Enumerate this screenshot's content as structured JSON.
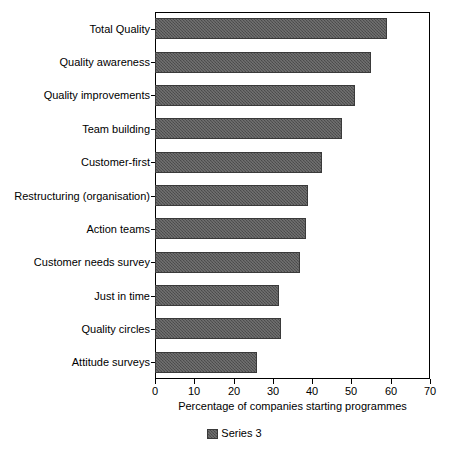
{
  "chart_data": {
    "type": "bar",
    "orientation": "horizontal",
    "title": "",
    "xlabel": "Percentage of companies starting programmes",
    "ylabel": "",
    "xlim": [
      0,
      70
    ],
    "xticks": [
      0,
      10,
      20,
      30,
      40,
      50,
      60,
      70
    ],
    "xtick_labels": [
      "0",
      "10",
      "20",
      "30",
      "40",
      "50",
      "60",
      "70"
    ],
    "grid": false,
    "legend": {
      "position": "bottom-center",
      "entries": [
        {
          "name": "Series 3",
          "color": "#555555"
        }
      ]
    },
    "categories": [
      "Total Quality",
      "Quality awareness",
      "Quality improvements",
      "Team building",
      "Customer-first",
      "Restructuring (organisation)",
      "Action teams",
      "Customer needs survey",
      "Just in time",
      "Quality circles",
      "Attitude surveys"
    ],
    "series": [
      {
        "name": "Series 3",
        "color": "#555555",
        "values": [
          59,
          55,
          51,
          47.5,
          42.5,
          39,
          38.5,
          37,
          31.5,
          32,
          26
        ]
      }
    ]
  },
  "colors": {
    "bar_fill": "#555555",
    "bar_edge": "#3a3a3a",
    "axis": "#000000",
    "background": "#ffffff"
  }
}
